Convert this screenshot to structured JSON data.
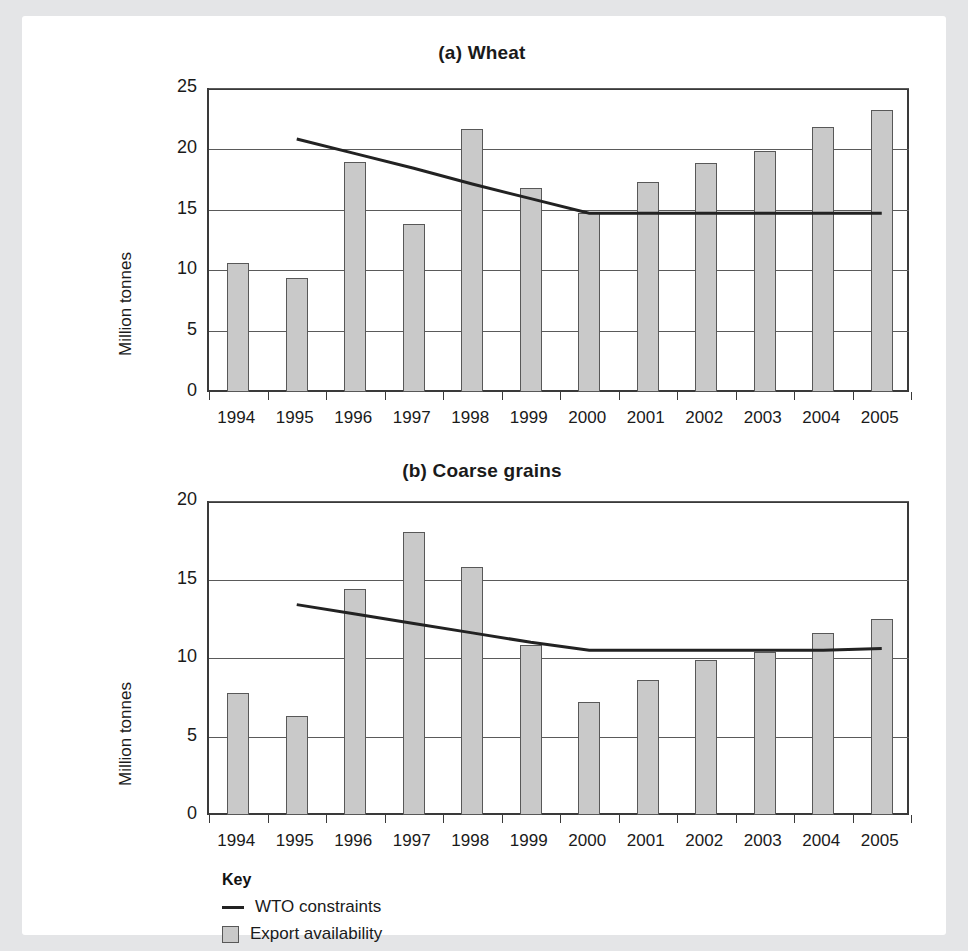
{
  "figure": {
    "ylabel": "Million tonnes",
    "key": {
      "title": "Key",
      "items": [
        {
          "label": "WTO constraints",
          "marker": "line",
          "color": "#222222"
        },
        {
          "label": "Export availability",
          "marker": "box",
          "color": "#c9c9c9"
        }
      ]
    }
  },
  "chart_data": [
    {
      "type": "bar",
      "title": "(a) Wheat",
      "xlabel": "",
      "ylabel": "Million tonnes",
      "ylim": [
        0,
        25
      ],
      "yticks": [
        0,
        5,
        10,
        15,
        20,
        25
      ],
      "ytick_labels": [
        "0",
        "5",
        "10",
        "15",
        "20",
        "25"
      ],
      "grid": true,
      "legend_position": "below-figure",
      "categories": [
        "1994",
        "1995",
        "1996",
        "1997",
        "1998",
        "1999",
        "2000",
        "2001",
        "2002",
        "2003",
        "2004",
        "2005"
      ],
      "series": [
        {
          "name": "Export availability",
          "type": "bar",
          "color": "#c9c9c9",
          "values": [
            10.6,
            9.35,
            18.9,
            13.8,
            21.6,
            16.8,
            14.7,
            17.3,
            18.8,
            19.8,
            21.8,
            23.2
          ]
        },
        {
          "name": "WTO constraints",
          "type": "line",
          "color": "#222222",
          "x": [
            "1995",
            "1996",
            "1997",
            "1998",
            "1999",
            "2000",
            "2001",
            "2002",
            "2003",
            "2004",
            "2005"
          ],
          "values": [
            20.8,
            19.6,
            18.4,
            17.1,
            15.9,
            14.7,
            14.7,
            14.7,
            14.7,
            14.7,
            14.7
          ]
        }
      ]
    },
    {
      "type": "bar",
      "title": "(b) Coarse grains",
      "xlabel": "",
      "ylabel": "Million tonnes",
      "ylim": [
        0,
        20
      ],
      "yticks": [
        0,
        5,
        10,
        15,
        20
      ],
      "ytick_labels": [
        "0",
        "5",
        "10",
        "15",
        "20"
      ],
      "grid": true,
      "legend_position": "below-figure",
      "categories": [
        "1994",
        "1995",
        "1996",
        "1997",
        "1998",
        "1999",
        "2000",
        "2001",
        "2002",
        "2003",
        "2004",
        "2005"
      ],
      "series": [
        {
          "name": "Export availability",
          "type": "bar",
          "color": "#c9c9c9",
          "values": [
            7.8,
            6.3,
            14.4,
            18.0,
            15.8,
            10.8,
            7.2,
            8.6,
            9.9,
            10.4,
            11.6,
            12.5
          ]
        },
        {
          "name": "WTO constraints",
          "type": "line",
          "color": "#222222",
          "x": [
            "1995",
            "1996",
            "1997",
            "1998",
            "1999",
            "2000",
            "2001",
            "2002",
            "2003",
            "2004",
            "2005"
          ],
          "values": [
            13.4,
            12.8,
            12.2,
            11.6,
            11.0,
            10.5,
            10.5,
            10.5,
            10.5,
            10.5,
            10.6
          ]
        }
      ]
    }
  ]
}
